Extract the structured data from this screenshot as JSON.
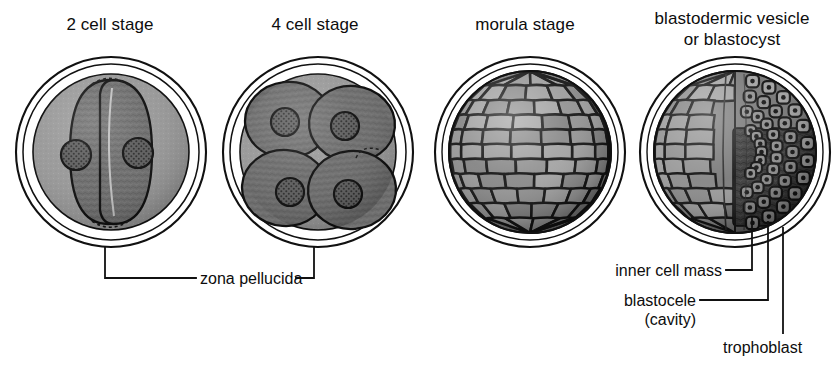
{
  "diagram": {
    "title_row": [
      {
        "id": "two-cell",
        "label": "2 cell stage",
        "x": 10,
        "y": 12,
        "w": 200
      },
      {
        "id": "four-cell",
        "label": "4 cell stage",
        "x": 215,
        "y": 12,
        "w": 200
      },
      {
        "id": "morula",
        "label": "morula stage",
        "x": 425,
        "y": 12,
        "w": 200
      },
      {
        "id": "blastocyst",
        "label": "blastodermic vesicle\nor blastocyst",
        "x": 630,
        "y": 12,
        "w": 206
      }
    ],
    "stage_titles": {
      "two_cell": "2 cell stage",
      "four_cell": "4 cell stage",
      "morula": "morula stage",
      "blastocyst_line1": "blastodermic vesicle",
      "blastocyst_line2": "or blastocyst"
    },
    "annotations": {
      "zona_pellucida": "zona pellucida",
      "inner_cell_mass": "inner cell mass",
      "blastocele_line1": "blastocele",
      "blastocele_line2": "(cavity)",
      "trophoblast": "trophoblast"
    },
    "colors": {
      "background": "#ffffff",
      "outline": "#111111",
      "cytoplasm": "#6e6e6e",
      "cytoplasm_dark": "#4a4a4a",
      "perivitelline": "#9a9a9a",
      "nucleus": "#5a5a5a",
      "inner_cell_mass": "#3a3a3a",
      "trophoblast_cell": "#8a8a8a",
      "leader_line": "#111111"
    },
    "structures": {
      "two_cell": {
        "cells": 2,
        "nuclei": 2
      },
      "four_cell": {
        "cells": 4,
        "nuclei": 4
      },
      "morula": {
        "cells": "many"
      },
      "blastocyst": {
        "parts": [
          "inner cell mass",
          "blastocele (cavity)",
          "trophoblast"
        ]
      }
    }
  }
}
